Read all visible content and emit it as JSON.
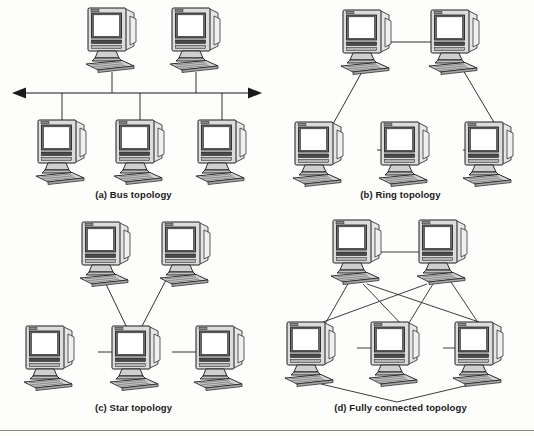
{
  "figure": {
    "line_color": "#1a1a1a",
    "monitor_body_color": "#d8d8d8",
    "screen_color": "#ffffff",
    "bezel_color": "#555555",
    "keyboard_color": "#c9c9c9",
    "background_color": "#fdfdfc"
  },
  "panels": [
    {
      "id": "bus",
      "label": "(a) Bus topology",
      "node_count": 5,
      "description": "Five computers attached by vertical drop lines to a horizontal double-headed bus line",
      "nodes": [
        {
          "name": "bus-top-left",
          "x": 112,
          "y": 40
        },
        {
          "name": "bus-top-right",
          "x": 196,
          "y": 40
        },
        {
          "name": "bus-bottom-left",
          "x": 62,
          "y": 148
        },
        {
          "name": "bus-bottom-mid",
          "x": 140,
          "y": 148
        },
        {
          "name": "bus-bottom-right",
          "x": 222,
          "y": 148
        }
      ],
      "bus_line": {
        "x1": 12,
        "x2": 262,
        "y": 93,
        "arrows": "both"
      }
    },
    {
      "id": "ring",
      "label": "(b) Ring topology",
      "node_count": 5,
      "description": "Five computers joined in a closed loop",
      "nodes": [
        {
          "name": "ring-top-left",
          "x": 82,
          "y": 40
        },
        {
          "name": "ring-top-right",
          "x": 182,
          "y": 40
        },
        {
          "name": "ring-bottom-left",
          "x": 48,
          "y": 148
        },
        {
          "name": "ring-bottom-mid",
          "x": 134,
          "y": 148
        },
        {
          "name": "ring-bottom-right",
          "x": 218,
          "y": 148
        }
      ],
      "edges": [
        [
          "ring-top-left",
          "ring-top-right"
        ],
        [
          "ring-top-right",
          "ring-bottom-right"
        ],
        [
          "ring-bottom-right",
          "ring-bottom-mid"
        ],
        [
          "ring-bottom-mid",
          "ring-bottom-left"
        ],
        [
          "ring-bottom-left",
          "ring-top-left"
        ]
      ]
    },
    {
      "id": "star",
      "label": "(c) Star topology",
      "node_count": 5,
      "description": "Four computers each connected to a single central computer",
      "nodes": [
        {
          "name": "star-top-left",
          "x": 104,
          "y": 32
        },
        {
          "name": "star-top-right",
          "x": 186,
          "y": 32
        },
        {
          "name": "star-left",
          "x": 46,
          "y": 132
        },
        {
          "name": "star-center",
          "x": 132,
          "y": 132
        },
        {
          "name": "star-right",
          "x": 218,
          "y": 132
        }
      ],
      "edges": [
        [
          "star-center",
          "star-top-left"
        ],
        [
          "star-center",
          "star-top-right"
        ],
        [
          "star-center",
          "star-left"
        ],
        [
          "star-center",
          "star-right"
        ]
      ]
    },
    {
      "id": "fully-connected",
      "label": "(d) Fully connected topology",
      "node_count": 5,
      "description": "Five computers with links between every pair, producing crossing diagonals",
      "nodes": [
        {
          "name": "mesh-top-left",
          "x": 88,
          "y": 30
        },
        {
          "name": "mesh-top-right",
          "x": 170,
          "y": 30
        },
        {
          "name": "mesh-bottom-left",
          "x": 40,
          "y": 128
        },
        {
          "name": "mesh-bottom-mid",
          "x": 124,
          "y": 128
        },
        {
          "name": "mesh-bottom-right",
          "x": 206,
          "y": 128
        }
      ],
      "edges": [
        [
          "mesh-top-left",
          "mesh-top-right"
        ],
        [
          "mesh-top-left",
          "mesh-bottom-left"
        ],
        [
          "mesh-top-left",
          "mesh-bottom-mid"
        ],
        [
          "mesh-top-left",
          "mesh-bottom-right"
        ],
        [
          "mesh-top-right",
          "mesh-bottom-left"
        ],
        [
          "mesh-top-right",
          "mesh-bottom-mid"
        ],
        [
          "mesh-top-right",
          "mesh-bottom-right"
        ],
        [
          "mesh-bottom-left",
          "mesh-bottom-mid"
        ],
        [
          "mesh-bottom-mid",
          "mesh-bottom-right"
        ],
        [
          "mesh-bottom-left",
          "mesh-bottom-right"
        ]
      ]
    }
  ]
}
